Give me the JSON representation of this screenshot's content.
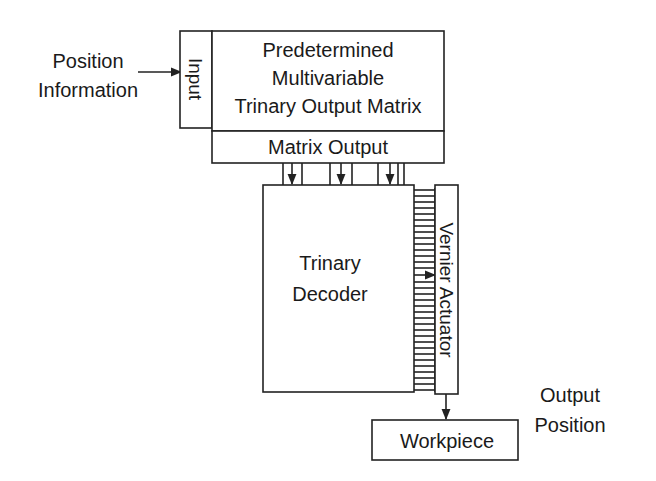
{
  "diagram": {
    "type": "block-diagram",
    "colors": {
      "line": "#222222",
      "text": "#1a1a1a",
      "background": "#ffffff"
    },
    "input_label": {
      "lines": [
        "Position",
        "Information"
      ]
    },
    "input_block": {
      "label": "Input"
    },
    "matrix_block": {
      "lines": [
        "Predetermined",
        "Multivariable",
        "Trinary Output Matrix"
      ]
    },
    "matrix_output_block": {
      "label": "Matrix Output"
    },
    "decoder_block": {
      "lines": [
        "Trinary",
        "Decoder"
      ]
    },
    "actuator_block": {
      "label": "Vernier Actuator"
    },
    "workpiece_block": {
      "label": "Workpiece"
    },
    "output_label": {
      "lines": [
        "Output",
        "Position"
      ]
    },
    "edges": [
      {
        "from": "Position Information",
        "to": "Input"
      },
      {
        "from": "Matrix Output",
        "to": "Trinary Decoder",
        "kind": "bus"
      },
      {
        "from": "Trinary Decoder",
        "to": "Vernier Actuator",
        "kind": "multi-line bus"
      },
      {
        "from": "Vernier Actuator",
        "to": "Workpiece"
      }
    ]
  }
}
